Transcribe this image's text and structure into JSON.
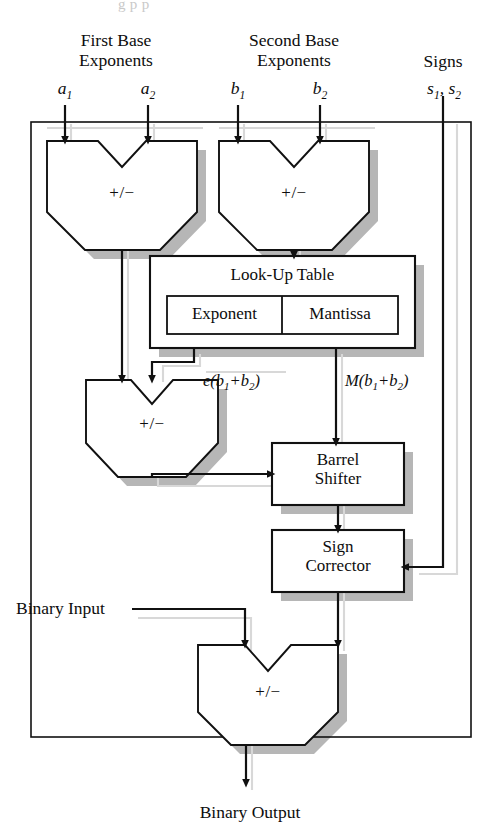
{
  "figure": {
    "title_fragment": "g p             p",
    "kind": "block-diagram"
  },
  "colors": {
    "line": "#111111",
    "shadow": "#b6b6b6",
    "box_fill": "#ffffff",
    "page": "#ffffff",
    "ghost_line": "#d8d8d8"
  },
  "inputs": {
    "group_first": {
      "label_line1": "First Base",
      "label_line2": "Exponents",
      "ports": [
        {
          "name": "a1",
          "text": "a",
          "sub": "1"
        },
        {
          "name": "a2",
          "text": "a",
          "sub": "2"
        }
      ]
    },
    "group_second": {
      "label_line1": "Second Base",
      "label_line2": "Exponents",
      "ports": [
        {
          "name": "b1",
          "text": "b",
          "sub": "1"
        },
        {
          "name": "b2",
          "text": "b",
          "sub": "2"
        }
      ]
    },
    "group_signs": {
      "label_line1": "Signs",
      "label_line2": "",
      "ports": [
        {
          "name": "s1_s2",
          "text": "s",
          "sub": "1",
          "text2": ", s",
          "sub2": "2"
        }
      ]
    },
    "binary_input": "Binary Input"
  },
  "outputs": {
    "binary_output": "Binary Output"
  },
  "blocks": {
    "adder_a": {
      "label": "+/−",
      "name": "First Base Exponent Adder/Subtractor"
    },
    "adder_b": {
      "label": "+/−",
      "name": "Second Base Exponent Adder/Subtractor"
    },
    "adder_c": {
      "label": "+/−",
      "name": "Exponent Combiner Adder/Subtractor"
    },
    "adder_d": {
      "label": "+/−",
      "name": "Final Binary Adder/Subtractor"
    },
    "lut": {
      "title": "Look-Up Table",
      "cells": [
        {
          "label": "Exponent"
        },
        {
          "label": "Mantissa"
        }
      ]
    },
    "barrel_shifter": {
      "line1": "Barrel",
      "line2": "Shifter"
    },
    "sign_corrector": {
      "line1": "Sign",
      "line2": "Corrector"
    }
  },
  "signal_labels": {
    "exponent_out": {
      "pre": "e(b",
      "sub1": "1",
      "mid": "+b",
      "sub2": "2",
      "post": ")"
    },
    "mantissa_out": {
      "pre": "M(b",
      "sub1": "1",
      "mid": "+b",
      "sub2": "2",
      "post": ")"
    }
  }
}
